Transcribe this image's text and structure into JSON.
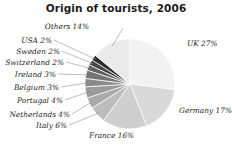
{
  "chart": {
    "title": "Origin of tourists, 2006"
  },
  "chart_data": {
    "type": "pie",
    "title": "Origin of tourists, 2006",
    "xlabel": "",
    "ylabel": "",
    "legend": "none",
    "grid": false,
    "value_unit": "%",
    "start_angle_deg": 0,
    "direction": "clockwise",
    "categories": [
      "UK",
      "Germany",
      "France",
      "Italy",
      "Netherlands",
      "Portugal",
      "Belgium",
      "Ireland",
      "Switzerland",
      "Sweden",
      "USA",
      "Others"
    ],
    "values": [
      27,
      17,
      16,
      6,
      4,
      4,
      3,
      3,
      2,
      2,
      2,
      14
    ],
    "labels": [
      {
        "name": "UK",
        "value": 27,
        "text": "UK 27%",
        "color": "#f2f2f2",
        "side": "right",
        "x": 187,
        "y": 44
      },
      {
        "name": "Germany",
        "value": 17,
        "text": "Germany 17%",
        "color": "#d9d9d9",
        "side": "right",
        "x": 179,
        "y": 111
      },
      {
        "name": "France",
        "value": 16,
        "text": "France 16%",
        "color": "#cfcfcf",
        "side": "right",
        "x": 89,
        "y": 136
      },
      {
        "name": "Italy",
        "value": 6,
        "text": "Italy 6%",
        "color": "#bdbdbd",
        "side": "left",
        "x": 67,
        "y": 126
      },
      {
        "name": "Netherlands",
        "value": 4,
        "text": "Netherlands 4%",
        "color": "#aaaaaa",
        "side": "left",
        "x": 70,
        "y": 115
      },
      {
        "name": "Portugal",
        "value": 4,
        "text": "Portugal 4%",
        "color": "#9a9a9a",
        "side": "left",
        "x": 63,
        "y": 101
      },
      {
        "name": "Belgium",
        "value": 3,
        "text": "Belgium 3%",
        "color": "#8a8a8a",
        "side": "left",
        "x": 59,
        "y": 88
      },
      {
        "name": "Ireland",
        "value": 3,
        "text": "Ireland 3%",
        "color": "#757575",
        "side": "left",
        "x": 56,
        "y": 75
      },
      {
        "name": "Switzerland",
        "value": 2,
        "text": "Switzerland 2%",
        "color": "#5f5f5f",
        "side": "left",
        "x": 64,
        "y": 63
      },
      {
        "name": "Sweden",
        "value": 2,
        "text": "Sweden 2%",
        "color": "#474747",
        "side": "left",
        "x": 60,
        "y": 52
      },
      {
        "name": "USA",
        "value": 2,
        "text": "USA 2%",
        "color": "#2e2e2e",
        "side": "left",
        "x": 52,
        "y": 41
      },
      {
        "name": "Others",
        "value": 14,
        "text": "Others 14%",
        "color": "#e6e6e6",
        "side": "top",
        "x": 89,
        "y": 27
      }
    ],
    "geometry": {
      "cx": 130,
      "cy": 84,
      "r": 45
    }
  }
}
